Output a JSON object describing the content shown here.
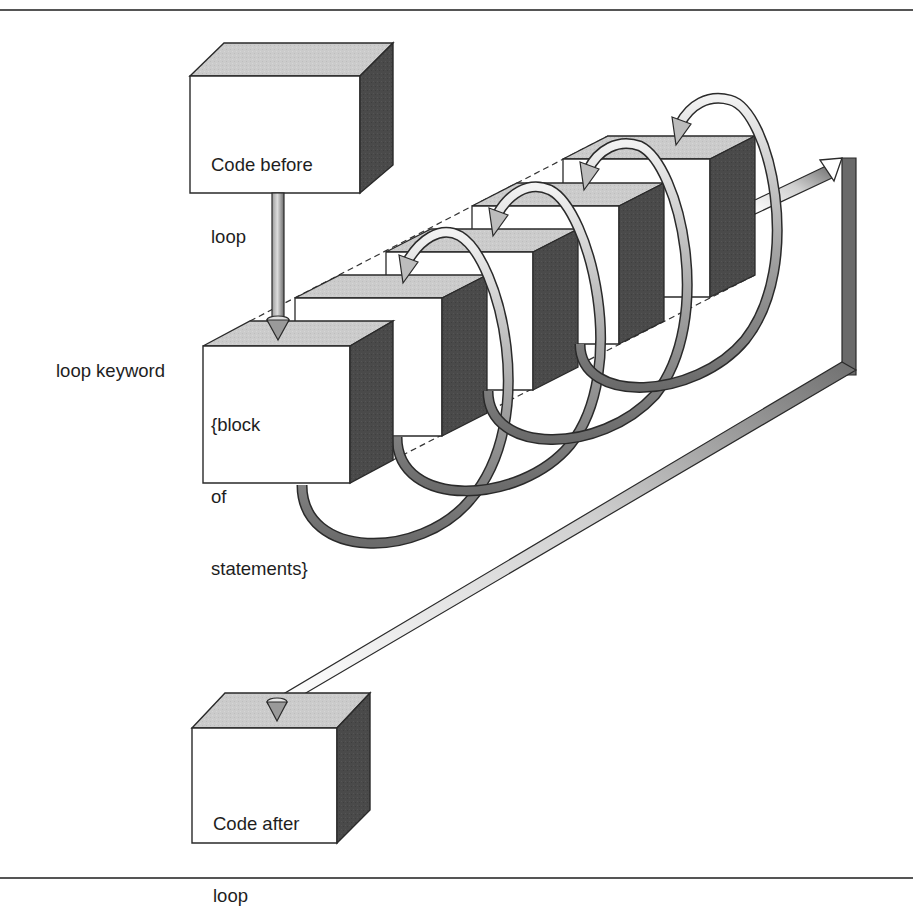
{
  "diagram": {
    "boxes": {
      "before": {
        "lines": [
          "Code before",
          "loop"
        ]
      },
      "loop_block": {
        "lines": [
          "{block",
          "of",
          "statements}"
        ]
      },
      "after": {
        "lines": [
          "Code after",
          "loop"
        ]
      }
    },
    "side_label": "loop keyword",
    "repeated_blocks": 5,
    "arrows": [
      {
        "from": "before",
        "to": "loop_block",
        "label": ""
      },
      {
        "from": "loop_block",
        "to": "loop_block",
        "kind": "iteration-loop",
        "count": 4
      },
      {
        "from": "loop_block",
        "to": "after",
        "kind": "exit-path"
      }
    ],
    "colors": {
      "front_face": "#ffffff",
      "top_face": "#c8c8c8",
      "side_face": "#4a4a4a",
      "pipe_dark": "#6b6b6b",
      "pipe_light": "#e8e8e8",
      "outline": "#2a2a2a",
      "rule": "#555555"
    }
  }
}
